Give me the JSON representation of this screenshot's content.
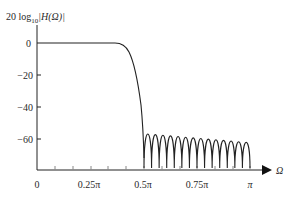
{
  "chart_data": {
    "type": "line",
    "title": "",
    "ylabel": "20 log10 |H(Ω)|",
    "ylabel_parts": {
      "prefix": "20 log",
      "sub": "10",
      "body": "|H(Ω)|"
    },
    "xlabel": "Ω",
    "x_ticks": [
      "0",
      "0.25π",
      "0.5π",
      "0.75π",
      "π"
    ],
    "x_tick_values": [
      0,
      0.25,
      0.5,
      0.75,
      1.0
    ],
    "y_ticks": [
      "0",
      "−20",
      "−40",
      "−60"
    ],
    "y_tick_values": [
      0,
      -20,
      -40,
      -60
    ],
    "xlim": [
      0,
      1.0
    ],
    "ylim": [
      -80,
      10
    ],
    "grid": false,
    "legend": null,
    "series": [
      {
        "name": "Lowpass filter magnitude response (dB)",
        "description": "Flat 0 dB passband to ~0.4π, transition to ~0.5π, stopband ripple lobes peaking near −50 to −60 dB with deep nulls",
        "passband_edge": 0.4,
        "stopband_edge": 0.5,
        "passband_level_db": 0,
        "first_sidelobe_db": -51,
        "last_sidelobe_db": -58,
        "sidelobe_count": 14,
        "x": [
          0,
          0.1,
          0.2,
          0.3,
          0.4,
          0.42,
          0.44,
          0.46,
          0.48,
          0.49,
          0.5
        ],
        "values": [
          0,
          0,
          0,
          0,
          0,
          -1,
          -5,
          -14,
          -30,
          -45,
          -72
        ]
      }
    ]
  }
}
